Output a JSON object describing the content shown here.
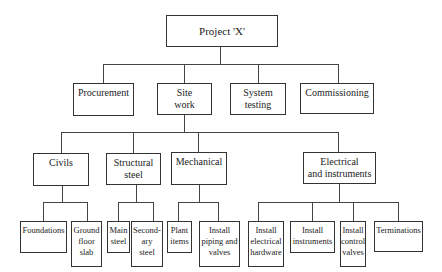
{
  "root": {
    "label": "Project 'X'"
  },
  "level1": [
    {
      "label": "Procurement"
    },
    {
      "label": "Site\nwork"
    },
    {
      "label": "System\ntesting"
    },
    {
      "label": "Commissioning"
    }
  ],
  "level2": [
    {
      "label": "Civils"
    },
    {
      "label": "Structural\nsteel"
    },
    {
      "label": "Mechanical"
    },
    {
      "label": "Electrical\nand instruments"
    }
  ],
  "level3": {
    "civils": [
      {
        "label": "Foundations"
      },
      {
        "label": "Ground\nfloor\nslab"
      }
    ],
    "structural_steel": [
      {
        "label": "Main\nsteel"
      },
      {
        "label": "Second-\nary\nsteel"
      }
    ],
    "mechanical": [
      {
        "label": "Plant\nitems"
      },
      {
        "label": "Install\npiping and\nvalves"
      }
    ],
    "electrical": [
      {
        "label": "Install\nelectrical\nhardware"
      },
      {
        "label": "Install\ninstruments"
      },
      {
        "label": "Install\ncontrol\nvalves"
      },
      {
        "label": "Terminations"
      }
    ]
  },
  "colors": {
    "line": "#444444",
    "border": "#333333",
    "text": "#222222",
    "background": "#ffffff"
  }
}
